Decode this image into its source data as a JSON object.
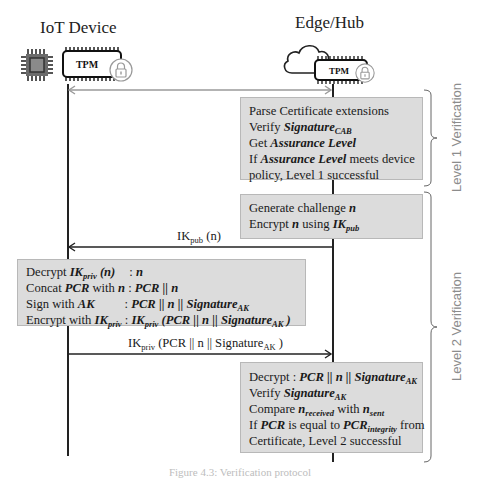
{
  "participants": {
    "left": {
      "title": "IoT Device",
      "chip_label": "TPM",
      "icons": [
        "cpu-chip-icon",
        "tpm-chip-icon",
        "lock-icon"
      ]
    },
    "right": {
      "title": "Edge/Hub",
      "chip_label": "TPM",
      "icons": [
        "cloud-icon",
        "tpm-chip-icon",
        "lock-icon"
      ]
    }
  },
  "messages": [
    {
      "id": "handshake",
      "direction": "both",
      "label": ""
    },
    {
      "id": "challenge",
      "direction": "right-to-left",
      "label_main": "IK",
      "label_sub": "pub",
      "label_rest": " (n)"
    },
    {
      "id": "response",
      "direction": "left-to-right",
      "label_main": "IK",
      "label_sub": "priv",
      "label_rest": " (PCR || n || Signature",
      "label_sub2": "AK",
      "label_end": " )"
    }
  ],
  "boxes": {
    "level1": {
      "line1": "Parse Certificate extensions",
      "line2_pre": "Verify ",
      "line2_b": "Signature",
      "line2_sub": "CAB",
      "line3_pre": "Get ",
      "line3_b": "Assurance Level",
      "line4_pre": "If ",
      "line4_b": "Assurance Level",
      "line4_post": " meets device",
      "line5": "policy, Level 1 successful"
    },
    "challenge": {
      "line1_pre": "Generate challenge ",
      "line1_b": "n",
      "line2_pre": "Encrypt ",
      "line2_b": "n",
      "line2_mid": " using ",
      "line2_b2": "IK",
      "line2_sub": "pub"
    },
    "device": {
      "r1_pre": "Decrypt ",
      "r1_b": "IK",
      "r1_sub": "priv",
      "r1_b2": " (n)",
      "r1_sep": ": ",
      "r1_val": "n",
      "r2_pre": "Concat ",
      "r2_b": "PCR",
      "r2_mid": " with ",
      "r2_b2": "n",
      "r2_sep": " : ",
      "r2_val": "PCR || n",
      "r3_pre": "Sign with ",
      "r3_b": "AK",
      "r3_sep": ": ",
      "r3_val": "PCR || n || Signature",
      "r3_sub": "AK",
      "r4_pre": "Encrypt with ",
      "r4_b": "IK",
      "r4_sub": "priv",
      "r4_sep": " : ",
      "r4_val_b": "IK",
      "r4_val_sub": "priv",
      "r4_val_rest": " (PCR || n || Signature",
      "r4_val_sub2": "AK",
      "r4_val_end": " )"
    },
    "level2": {
      "l1_pre": "Decrypt : ",
      "l1_b": "PCR || n || Signature",
      "l1_sub": "AK",
      "l2_pre": "Verify ",
      "l2_b": "Signature",
      "l2_sub": "AK",
      "l3_pre": "Compare ",
      "l3_b": "n",
      "l3_sub": "received",
      "l3_mid": " with ",
      "l3_b2": "n",
      "l3_sub2": "sent",
      "l4_pre": "If ",
      "l4_b": "PCR",
      "l4_mid": " is equal to ",
      "l4_b2": "PCR",
      "l4_sub": "integrity",
      "l4_post": " from",
      "l5": "Certificate, Level 2 successful"
    }
  },
  "phases": [
    {
      "label": "Level 1 Verification"
    },
    {
      "label": "Level 2 Verification"
    }
  ],
  "caption": "Figure 4.3: Verification protocol",
  "colors": {
    "box_fill": "#dcdcdc",
    "box_border": "#b8b8b8",
    "line": "#222222",
    "arrow_gray": "#9a9a9a",
    "phase_label": "#8c8c8c"
  }
}
